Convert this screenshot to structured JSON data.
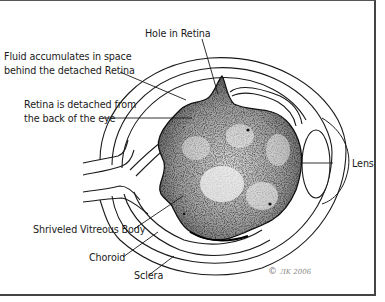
{
  "diagram": {
    "labels": {
      "hole_in_retina": "Hole in Retina",
      "fluid_line1": "Fluid accumulates in space",
      "fluid_line2": "behind the detached Retina",
      "retina_line1": "Retina is detached from",
      "retina_line2": "the back of the eye",
      "lens": "Lens",
      "vitreous": "Shriveled Vitreous Body",
      "choroid": "Choroid",
      "sclera": "Sclera"
    },
    "copyright": {
      "symbol": "©",
      "text": "ЛK 2006"
    },
    "colors": {
      "line": "#1a1a1a",
      "frame": "#444444",
      "vitreous_fill": "#8a8a8a",
      "background": "#ffffff"
    }
  }
}
